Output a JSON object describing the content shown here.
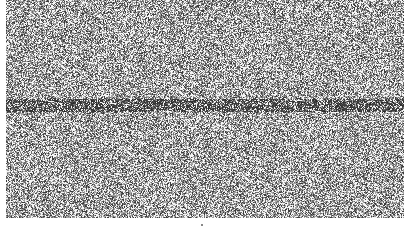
{
  "image": {
    "description": "Grayscale noise texture with a darker horizontal band of irregular marks near the vertical middle",
    "width": 413,
    "height": 230,
    "background_color": "#ffffff",
    "noise_region": {
      "x": 6,
      "y": 0,
      "width": 398,
      "height": 218
    },
    "band": {
      "y_center": 105,
      "thickness": 14,
      "color": "#222222"
    },
    "bottom_mark": {
      "x": 201,
      "y": 224,
      "color": "#888888"
    },
    "noise_colors": {
      "light": "#f2f2f2",
      "mid": "#9a9a9a",
      "dark": "#3a3a3a"
    }
  }
}
